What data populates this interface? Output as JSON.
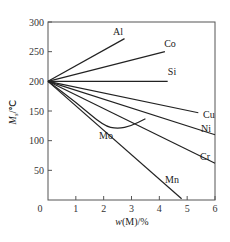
{
  "chart_data": {
    "type": "line",
    "title": "",
    "xlabel": "w(M)/%",
    "ylabel": "Ms/℃",
    "xlim": [
      0,
      6
    ],
    "ylim": [
      0,
      300
    ],
    "x_ticks": [
      0,
      1,
      2,
      3,
      4,
      5,
      6
    ],
    "y_ticks": [
      50,
      100,
      150,
      200,
      250,
      300
    ],
    "origin_label": "0",
    "grid": false,
    "legend": "inline labels at line ends",
    "series": [
      {
        "name": "Al",
        "x": [
          0,
          2.75
        ],
        "y": [
          200,
          272
        ]
      },
      {
        "name": "Co",
        "x": [
          0,
          4.2
        ],
        "y": [
          200,
          250
        ]
      },
      {
        "name": "Si",
        "x": [
          0,
          4.3
        ],
        "y": [
          200,
          200
        ]
      },
      {
        "name": "Cu",
        "x": [
          0,
          5.4
        ],
        "y": [
          200,
          147
        ]
      },
      {
        "name": "Ni",
        "x": [
          0,
          6.0
        ],
        "y": [
          200,
          110
        ]
      },
      {
        "name": "Cr",
        "x": [
          0,
          6.0
        ],
        "y": [
          200,
          62
        ]
      },
      {
        "name": "Mo",
        "x": [
          0,
          1.0,
          2.0,
          2.5,
          3.0,
          3.5
        ],
        "y": [
          200,
          165,
          125,
          120,
          125,
          137
        ]
      },
      {
        "name": "Mn",
        "x": [
          0,
          4.8
        ],
        "y": [
          200,
          2
        ]
      }
    ]
  }
}
